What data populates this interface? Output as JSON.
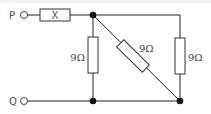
{
  "diagram": {
    "type": "circuit",
    "terminals": [
      {
        "id": "P",
        "label": "P"
      },
      {
        "id": "Q",
        "label": "Q"
      }
    ],
    "components": [
      {
        "id": "X",
        "label": "X",
        "kind": "resistor",
        "position": "series-top"
      },
      {
        "id": "R1",
        "label": "9Ω",
        "kind": "resistor",
        "position": "left-vertical"
      },
      {
        "id": "R2",
        "label": "9Ω",
        "kind": "resistor",
        "position": "diagonal"
      },
      {
        "id": "R3",
        "label": "9Ω",
        "kind": "resistor",
        "position": "right-vertical"
      }
    ],
    "colors": {
      "wire": "#222222",
      "node": "#111111",
      "background": "#ffffff"
    }
  }
}
